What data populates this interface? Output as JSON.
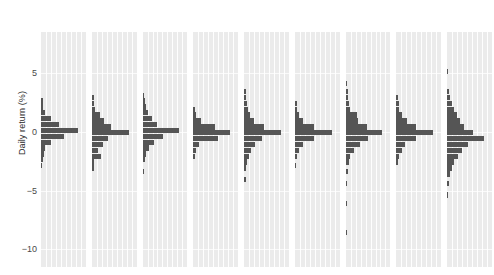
{
  "chart_data": {
    "type": "bar",
    "title": "",
    "subtitle": "",
    "xlabel": "",
    "ylabel": "Daily return (%)",
    "orientation": "horizontal-histogram-per-panel",
    "grid": true,
    "legend": null,
    "ylim": [
      -11.5,
      8.5
    ],
    "yticks": [
      5,
      0,
      -5,
      -10
    ],
    "ytick_labels": [
      "5",
      "0",
      "−5",
      "−10"
    ],
    "panel_labels": [
      "2014",
      "2015",
      "2016",
      "2017",
      "2018",
      "2019",
      "2020",
      "2021",
      "2022"
    ],
    "bin_width": 0.5,
    "bar_color": "#555555",
    "panel_background": "#ebebeb",
    "note": "Each panel is a histogram of daily returns for that year; bars extend rightward from the panel left edge, bin centers given on the vertical Daily return (%) axis.",
    "panels": [
      {
        "label": "2014",
        "bins": [
          {
            "center": 2.6,
            "count": 0.06
          },
          {
            "center": 2.1,
            "count": 0.06
          },
          {
            "center": 1.6,
            "count": 0.1
          },
          {
            "center": 1.1,
            "count": 0.28
          },
          {
            "center": 0.6,
            "count": 0.48
          },
          {
            "center": 0.1,
            "count": 1.0
          },
          {
            "center": -0.4,
            "count": 0.62
          },
          {
            "center": -0.9,
            "count": 0.26
          },
          {
            "center": -1.4,
            "count": 0.12
          },
          {
            "center": -1.9,
            "count": 0.07
          },
          {
            "center": -2.4,
            "count": 0.05
          },
          {
            "center": -2.9,
            "count": 0.04
          }
        ]
      },
      {
        "label": "2015",
        "bins": [
          {
            "center": 2.9,
            "count": 0.05
          },
          {
            "center": 2.4,
            "count": 0.06
          },
          {
            "center": 1.9,
            "count": 0.1
          },
          {
            "center": 1.4,
            "count": 0.22
          },
          {
            "center": 0.9,
            "count": 0.33
          },
          {
            "center": 0.4,
            "count": 0.52
          },
          {
            "center": -0.1,
            "count": 1.0
          },
          {
            "center": -0.6,
            "count": 0.44
          },
          {
            "center": -1.1,
            "count": 0.3
          },
          {
            "center": -1.6,
            "count": 0.16
          },
          {
            "center": -2.1,
            "count": 0.24
          },
          {
            "center": -2.6,
            "count": 0.07
          },
          {
            "center": -3.1,
            "count": 0.05
          }
        ]
      },
      {
        "label": "2016",
        "bins": [
          {
            "center": 3.1,
            "count": 0.05
          },
          {
            "center": 2.6,
            "count": 0.06
          },
          {
            "center": 2.1,
            "count": 0.08
          },
          {
            "center": 1.6,
            "count": 0.14
          },
          {
            "center": 1.1,
            "count": 0.26
          },
          {
            "center": 0.6,
            "count": 0.4
          },
          {
            "center": 0.1,
            "count": 1.0
          },
          {
            "center": -0.4,
            "count": 0.56
          },
          {
            "center": -0.9,
            "count": 0.3
          },
          {
            "center": -1.4,
            "count": 0.18
          },
          {
            "center": -1.9,
            "count": 0.1
          },
          {
            "center": -2.4,
            "count": 0.06
          },
          {
            "center": -3.4,
            "count": 0.04
          }
        ]
      },
      {
        "label": "2017",
        "bins": [
          {
            "center": 1.9,
            "count": 0.05
          },
          {
            "center": 1.4,
            "count": 0.08
          },
          {
            "center": 0.9,
            "count": 0.22
          },
          {
            "center": 0.4,
            "count": 0.6
          },
          {
            "center": -0.1,
            "count": 1.0
          },
          {
            "center": -0.6,
            "count": 0.66
          },
          {
            "center": -1.1,
            "count": 0.16
          },
          {
            "center": -1.6,
            "count": 0.07
          },
          {
            "center": -2.1,
            "count": 0.04
          }
        ]
      },
      {
        "label": "2018",
        "bins": [
          {
            "center": 3.4,
            "count": 0.04
          },
          {
            "center": 2.9,
            "count": 0.05
          },
          {
            "center": 2.4,
            "count": 0.07
          },
          {
            "center": 1.9,
            "count": 0.1
          },
          {
            "center": 1.4,
            "count": 0.16
          },
          {
            "center": 0.9,
            "count": 0.26
          },
          {
            "center": 0.4,
            "count": 0.55
          },
          {
            "center": -0.1,
            "count": 1.0
          },
          {
            "center": -0.6,
            "count": 0.48
          },
          {
            "center": -1.1,
            "count": 0.3
          },
          {
            "center": -1.6,
            "count": 0.2
          },
          {
            "center": -2.1,
            "count": 0.12
          },
          {
            "center": -2.6,
            "count": 0.08
          },
          {
            "center": -3.1,
            "count": 0.06
          },
          {
            "center": -4.1,
            "count": 0.04
          }
        ]
      },
      {
        "label": "2019",
        "bins": [
          {
            "center": 2.4,
            "count": 0.05
          },
          {
            "center": 1.9,
            "count": 0.06
          },
          {
            "center": 1.4,
            "count": 0.1
          },
          {
            "center": 0.9,
            "count": 0.22
          },
          {
            "center": 0.4,
            "count": 0.52
          },
          {
            "center": -0.1,
            "count": 1.0
          },
          {
            "center": -0.6,
            "count": 0.52
          },
          {
            "center": -1.1,
            "count": 0.22
          },
          {
            "center": -1.6,
            "count": 0.12
          },
          {
            "center": -2.1,
            "count": 0.07
          },
          {
            "center": -2.9,
            "count": 0.04
          }
        ]
      },
      {
        "label": "2020",
        "bins": [
          {
            "center": 4.1,
            "count": 0.04
          },
          {
            "center": 3.4,
            "count": 0.05
          },
          {
            "center": 2.9,
            "count": 0.06
          },
          {
            "center": 2.4,
            "count": 0.08
          },
          {
            "center": 1.9,
            "count": 0.12
          },
          {
            "center": 1.4,
            "count": 0.3
          },
          {
            "center": 0.9,
            "count": 0.34
          },
          {
            "center": 0.4,
            "count": 0.58
          },
          {
            "center": -0.1,
            "count": 1.0
          },
          {
            "center": -0.6,
            "count": 0.6
          },
          {
            "center": -1.1,
            "count": 0.4
          },
          {
            "center": -1.6,
            "count": 0.22
          },
          {
            "center": -2.1,
            "count": 0.13
          },
          {
            "center": -2.6,
            "count": 0.09
          },
          {
            "center": -3.4,
            "count": 0.06
          },
          {
            "center": -4.4,
            "count": 0.04
          },
          {
            "center": -6.1,
            "count": 0.03
          },
          {
            "center": -8.6,
            "count": 0.03
          }
        ]
      },
      {
        "label": "2021",
        "bins": [
          {
            "center": 2.9,
            "count": 0.05
          },
          {
            "center": 2.4,
            "count": 0.06
          },
          {
            "center": 1.9,
            "count": 0.08
          },
          {
            "center": 1.4,
            "count": 0.14
          },
          {
            "center": 0.9,
            "count": 0.3
          },
          {
            "center": 0.4,
            "count": 0.54
          },
          {
            "center": -0.1,
            "count": 1.0
          },
          {
            "center": -0.6,
            "count": 0.52
          },
          {
            "center": -1.1,
            "count": 0.24
          },
          {
            "center": -1.6,
            "count": 0.14
          },
          {
            "center": -2.1,
            "count": 0.08
          },
          {
            "center": -2.6,
            "count": 0.05
          }
        ]
      },
      {
        "label": "2022",
        "bins": [
          {
            "center": 5.1,
            "count": 0.03
          },
          {
            "center": 3.4,
            "count": 0.05
          },
          {
            "center": 2.9,
            "count": 0.08
          },
          {
            "center": 2.4,
            "count": 0.12
          },
          {
            "center": 1.9,
            "count": 0.18
          },
          {
            "center": 1.4,
            "count": 0.26
          },
          {
            "center": 0.9,
            "count": 0.34
          },
          {
            "center": 0.4,
            "count": 0.46
          },
          {
            "center": -0.1,
            "count": 0.7
          },
          {
            "center": -0.6,
            "count": 1.0
          },
          {
            "center": -1.1,
            "count": 0.56
          },
          {
            "center": -1.6,
            "count": 0.4
          },
          {
            "center": -2.1,
            "count": 0.28
          },
          {
            "center": -2.6,
            "count": 0.18
          },
          {
            "center": -3.1,
            "count": 0.12
          },
          {
            "center": -3.6,
            "count": 0.08
          },
          {
            "center": -4.4,
            "count": 0.05
          },
          {
            "center": -5.4,
            "count": 0.03
          }
        ]
      }
    ]
  }
}
